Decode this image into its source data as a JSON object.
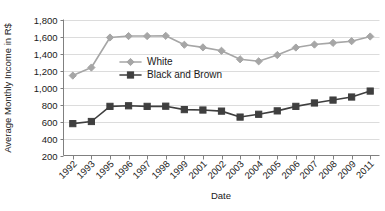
{
  "chart_data": {
    "type": "line",
    "title": "",
    "xlabel": "Date",
    "ylabel": "Average Monthly Income in R$",
    "ylim": [
      200,
      1800
    ],
    "ytick_step": 200,
    "yticks": [
      "200",
      "400",
      "600",
      "800",
      "1,000",
      "1,200",
      "1,400",
      "1,600",
      "1,800"
    ],
    "grid": true,
    "legend_position": "inside-upper-center",
    "categories": [
      "1992",
      "1993",
      "1995",
      "1996",
      "1997",
      "1998",
      "1999",
      "2001",
      "2002",
      "2003",
      "2004",
      "2005",
      "2006",
      "2007",
      "2008",
      "2009",
      "2011"
    ],
    "series": [
      {
        "name": "White",
        "color": "#a6a6a6",
        "marker": "diamond",
        "values": [
          1140,
          1235,
          1588,
          1605,
          1605,
          1608,
          1503,
          1472,
          1432,
          1332,
          1308,
          1382,
          1470,
          1505,
          1525,
          1545,
          1600
        ]
      },
      {
        "name": "Black and Brown",
        "color": "#3f3f3f",
        "marker": "square",
        "values": [
          575,
          600,
          778,
          785,
          778,
          780,
          740,
          735,
          722,
          652,
          685,
          725,
          778,
          818,
          852,
          888,
          958
        ]
      }
    ]
  },
  "legend": {
    "items": [
      {
        "label": "White"
      },
      {
        "label": "Black and Brown"
      }
    ]
  },
  "axes": {
    "y_title": "Average Monthly Income in R$",
    "x_title": "Date"
  }
}
